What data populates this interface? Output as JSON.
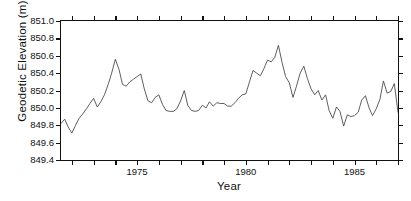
{
  "chart_data": {
    "type": "line",
    "title": "",
    "xlabel": "Year",
    "ylabel": "Geodetic Elevation (m)",
    "xlim": [
      1971.5,
      1987.0
    ],
    "ylim": [
      849.4,
      851.0
    ],
    "grid": false,
    "legend": null,
    "line_color": "#4d4d4d",
    "axis_color": "#111111",
    "background": "#ffffff",
    "ytick_labels": [
      "851.0",
      "850.8",
      "850.6",
      "850.4",
      "850.2",
      "850.0",
      "849.8",
      "849.6",
      "849.4"
    ],
    "ytick_values": [
      851.0,
      850.8,
      850.6,
      850.4,
      850.2,
      850.0,
      849.8,
      849.6,
      849.4
    ],
    "xtick_labels": [
      "1975",
      "1980",
      "1985"
    ],
    "xtick_values": [
      1975,
      1980,
      1985
    ],
    "xminor_values": [
      1972,
      1973,
      1974,
      1976,
      1977,
      1978,
      1979,
      1981,
      1982,
      1983,
      1984,
      1986,
      1987
    ],
    "series": [
      {
        "name": "Geodetic Elevation",
        "x": [
          1971.5,
          1971.67,
          1971.83,
          1972.0,
          1972.17,
          1972.33,
          1972.5,
          1972.67,
          1972.83,
          1973.0,
          1973.17,
          1973.33,
          1973.5,
          1973.67,
          1973.83,
          1974.0,
          1974.17,
          1974.33,
          1974.5,
          1974.67,
          1974.83,
          1975.0,
          1975.17,
          1975.33,
          1975.5,
          1975.67,
          1975.83,
          1976.0,
          1976.17,
          1976.33,
          1976.5,
          1976.67,
          1976.83,
          1977.0,
          1977.17,
          1977.33,
          1977.5,
          1977.67,
          1977.83,
          1978.0,
          1978.17,
          1978.33,
          1978.5,
          1978.67,
          1978.83,
          1979.0,
          1979.17,
          1979.33,
          1979.5,
          1979.67,
          1979.83,
          1980.0,
          1980.17,
          1980.33,
          1980.5,
          1980.67,
          1980.83,
          1981.0,
          1981.17,
          1981.33,
          1981.5,
          1981.67,
          1981.83,
          1982.0,
          1982.17,
          1982.33,
          1982.5,
          1982.67,
          1982.83,
          1983.0,
          1983.17,
          1983.33,
          1983.5,
          1983.67,
          1983.83,
          1984.0,
          1984.17,
          1984.33,
          1984.5,
          1984.67,
          1984.83,
          1985.0,
          1985.17,
          1985.33,
          1985.5,
          1985.67,
          1985.83,
          1986.0,
          1986.17,
          1986.33,
          1986.5,
          1986.67,
          1986.83,
          1987.0
        ],
        "y": [
          849.82,
          849.87,
          849.78,
          849.71,
          849.8,
          849.88,
          849.93,
          849.99,
          850.05,
          850.11,
          850.01,
          850.07,
          850.15,
          850.27,
          850.4,
          850.56,
          850.44,
          850.27,
          850.25,
          850.3,
          850.33,
          850.36,
          850.39,
          850.22,
          850.08,
          850.06,
          850.12,
          850.15,
          850.04,
          849.97,
          849.96,
          849.96,
          849.99,
          850.08,
          850.2,
          850.03,
          849.97,
          849.96,
          849.97,
          850.03,
          850.0,
          850.07,
          850.02,
          850.06,
          850.05,
          850.05,
          850.02,
          850.02,
          850.06,
          850.11,
          850.15,
          850.16,
          850.3,
          850.43,
          850.4,
          850.37,
          850.45,
          850.55,
          850.53,
          850.58,
          850.72,
          850.52,
          850.36,
          850.29,
          850.12,
          850.25,
          850.4,
          850.48,
          850.34,
          850.22,
          850.15,
          850.2,
          850.09,
          850.15,
          849.97,
          849.88,
          850.01,
          849.96,
          849.79,
          849.92,
          849.9,
          849.91,
          849.95,
          850.09,
          850.14,
          850.0,
          849.91,
          849.99,
          850.1,
          850.31,
          850.17,
          850.19,
          850.28,
          849.95
        ]
      }
    ]
  },
  "figure": {
    "xlabel_text": "Year",
    "ylabel_text": "Geodetic Elevation (m)"
  }
}
